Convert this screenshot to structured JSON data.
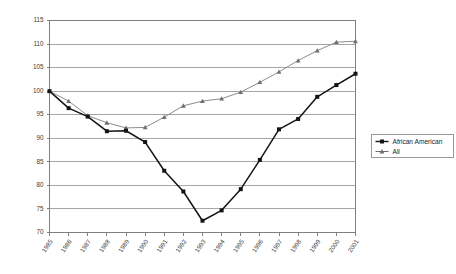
{
  "chart_data": {
    "type": "line",
    "title": "",
    "subtitle": "",
    "xlabel": "",
    "ylabel": "",
    "grid": true,
    "gridlines": "horizontal",
    "legend_position": "right",
    "ylim": [
      70,
      115
    ],
    "ytick_step": 5,
    "yticks": [
      70,
      75,
      80,
      85,
      90,
      95,
      100,
      105,
      110,
      115
    ],
    "categories": [
      "1985",
      "1986",
      "1987",
      "1988",
      "1989",
      "1990",
      "1991",
      "1992",
      "1993",
      "1994",
      "1995",
      "1996",
      "1997",
      "1998",
      "1999",
      "2000",
      "2001"
    ],
    "x": [
      1985,
      1986,
      1987,
      1988,
      1989,
      1990,
      1991,
      1992,
      1993,
      1994,
      1995,
      1996,
      1997,
      1998,
      1999,
      2000,
      2001
    ],
    "series": [
      {
        "name": "African American",
        "color": "#141414",
        "marker": "square",
        "values": [
          100.0,
          96.4,
          94.6,
          91.5,
          91.6,
          89.2,
          83.1,
          78.7,
          72.5,
          74.7,
          79.2,
          85.4,
          91.9,
          94.1,
          98.8,
          101.3,
          103.7
        ]
      },
      {
        "name": "All",
        "color": "#6e6e6e",
        "marker": "triangle",
        "values": [
          100.0,
          97.9,
          94.8,
          93.3,
          92.2,
          92.3,
          94.5,
          96.9,
          97.9,
          98.4,
          99.8,
          101.9,
          104.1,
          106.5,
          108.6,
          110.4,
          110.6
        ]
      }
    ],
    "legend": [
      {
        "label": "African American",
        "color": "#141414",
        "marker": "square"
      },
      {
        "label": "All",
        "color": "#6e6e6e",
        "marker": "triangle"
      }
    ]
  },
  "colors": {
    "axis": "#808080",
    "grid": "#a6a6a6",
    "series_african_american": "#141414",
    "series_all": "#6e6e6e",
    "background": "#ffffff"
  }
}
